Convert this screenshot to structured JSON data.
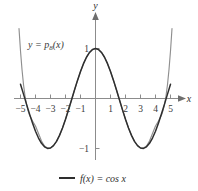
{
  "chart_data": {
    "type": "line",
    "title": "",
    "xlabel": "x",
    "ylabel": "y",
    "xlim": [
      -5.4,
      5.4
    ],
    "ylim": [
      -1.55,
      1.45
    ],
    "grid": false,
    "axis_style": "cartesian-arrows",
    "xticks": [
      -5,
      -4,
      -3,
      -2,
      -1,
      1,
      2,
      3,
      4,
      5
    ],
    "xticklabels": [
      "−5",
      "−4",
      "−3",
      "−2",
      "−1",
      "1",
      "2",
      "3",
      "4",
      "5"
    ],
    "yticks": [
      1,
      -1
    ],
    "yticklabels": [
      "1",
      "−1"
    ],
    "legend_position": "bottom-center",
    "annotations": [
      {
        "name": "polynomial-curve-label",
        "text_main": "y = p",
        "text_sub": "8",
        "text_tail": "(x)",
        "x": -3.6,
        "y": 1.0
      }
    ],
    "series": [
      {
        "name": "f(x) = cos x",
        "label": "f(x) = cos x",
        "color": "#2e2e2e",
        "in_legend": true,
        "x": [
          -5.0,
          -4.8,
          -4.6,
          -4.4,
          -4.2,
          -4.0,
          -3.8,
          -3.6,
          -3.4,
          -3.2,
          -3.0,
          -2.8,
          -2.6,
          -2.4,
          -2.2,
          -2.0,
          -1.8,
          -1.6,
          -1.4,
          -1.2,
          -1.0,
          -0.8,
          -0.6,
          -0.4,
          -0.2,
          0.0,
          0.2,
          0.4,
          0.6,
          0.8,
          1.0,
          1.2,
          1.4,
          1.6,
          1.8,
          2.0,
          2.2,
          2.4,
          2.6,
          2.8,
          3.0,
          3.2,
          3.4,
          3.6,
          3.8,
          4.0,
          4.2,
          4.4,
          4.6,
          4.8,
          5.0
        ],
        "y": [
          0.284,
          0.087,
          -0.112,
          -0.307,
          -0.49,
          -0.654,
          -0.791,
          -0.897,
          -0.967,
          -0.998,
          -0.99,
          -0.942,
          -0.857,
          -0.737,
          -0.589,
          -0.416,
          -0.227,
          -0.029,
          0.17,
          0.362,
          0.54,
          0.697,
          0.825,
          0.921,
          0.98,
          1.0,
          0.98,
          0.921,
          0.825,
          0.697,
          0.54,
          0.362,
          0.17,
          -0.029,
          -0.227,
          -0.416,
          -0.589,
          -0.737,
          -0.857,
          -0.942,
          -0.99,
          -0.998,
          -0.967,
          -0.897,
          -0.791,
          -0.654,
          -0.49,
          -0.307,
          -0.112,
          0.087,
          0.284
        ]
      },
      {
        "name": "p8(x)",
        "label": "y = p8(x)",
        "color": "#8f8f8f",
        "in_legend": false,
        "description": "Eighth-degree Taylor polynomial of cos x centered at 0",
        "x": [
          -5.3,
          -5.2,
          -5.1,
          -5.0,
          -4.9,
          -4.8,
          -4.7,
          -4.6,
          -4.5,
          -4.4,
          -4.2,
          -4.0,
          -3.8,
          -3.6,
          -3.4,
          -3.2,
          -3.0,
          -2.8,
          -2.6,
          -2.4,
          -2.2,
          -2.0,
          -1.8,
          -1.6,
          -1.4,
          -1.2,
          -1.0,
          -0.8,
          -0.6,
          -0.4,
          -0.2,
          0.0,
          0.2,
          0.4,
          0.6,
          0.8,
          1.0,
          1.2,
          1.4,
          1.6,
          1.8,
          2.0,
          2.2,
          2.4,
          2.6,
          2.8,
          3.0,
          3.2,
          3.4,
          3.6,
          3.8,
          4.0,
          4.2,
          4.4,
          4.5,
          4.6,
          4.7,
          4.8,
          4.9,
          5.0,
          5.1,
          5.2,
          5.3
        ],
        "y": [
          2.55,
          1.93,
          1.4,
          0.95,
          0.58,
          0.28,
          0.05,
          -0.12,
          -0.24,
          -0.33,
          -0.45,
          -0.55,
          -0.7,
          -0.85,
          -0.95,
          -0.99,
          -0.99,
          -0.94,
          -0.86,
          -0.74,
          -0.59,
          -0.42,
          -0.23,
          -0.03,
          0.17,
          0.36,
          0.54,
          0.7,
          0.83,
          0.92,
          0.98,
          1.0,
          0.98,
          0.92,
          0.83,
          0.7,
          0.54,
          0.36,
          0.17,
          -0.03,
          -0.23,
          -0.42,
          -0.59,
          -0.74,
          -0.86,
          -0.94,
          -0.99,
          -0.99,
          -0.95,
          -0.85,
          -0.7,
          -0.55,
          -0.45,
          -0.33,
          -0.24,
          -0.12,
          0.05,
          0.28,
          0.58,
          0.95,
          1.4,
          1.93,
          2.55
        ]
      }
    ],
    "legend": [
      {
        "name": "cosine-legend-entry",
        "label": "f(x) = cos x",
        "color": "#2e2e2e"
      }
    ]
  },
  "figure": {
    "background_color": "#ffffff",
    "axis_color": "#8c8c8c"
  }
}
